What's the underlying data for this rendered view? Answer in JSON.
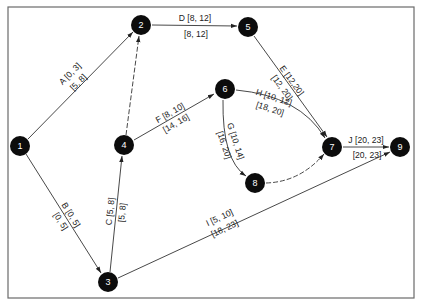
{
  "diagram": {
    "type": "activity-on-arrow network",
    "nodes": [
      {
        "id": "1",
        "x": 20,
        "y": 146
      },
      {
        "id": "2",
        "x": 141,
        "y": 25
      },
      {
        "id": "3",
        "x": 108,
        "y": 282
      },
      {
        "id": "4",
        "x": 124,
        "y": 145
      },
      {
        "id": "5",
        "x": 248,
        "y": 27
      },
      {
        "id": "6",
        "x": 225,
        "y": 89
      },
      {
        "id": "7",
        "x": 332,
        "y": 147
      },
      {
        "id": "8",
        "x": 255,
        "y": 183
      },
      {
        "id": "9",
        "x": 400,
        "y": 147
      }
    ],
    "activities": [
      {
        "name": "A",
        "from": "1",
        "to": "2",
        "es_ef": "A [0, 3]",
        "ls_lf": "[5, 8]"
      },
      {
        "name": "B",
        "from": "1",
        "to": "3",
        "es_ef": "B [0, 5]",
        "ls_lf": "[0, 5]"
      },
      {
        "name": "C",
        "from": "3",
        "to": "4",
        "es_ef": "C [5, 8]",
        "ls_lf": "[5, 8]"
      },
      {
        "name": "D",
        "from": "2",
        "to": "5",
        "es_ef": "D [8, 12]",
        "ls_lf": "[8, 12]"
      },
      {
        "name": "E",
        "from": "5",
        "to": "7",
        "es_ef": "E [12,20]",
        "ls_lf": "[12, 20]"
      },
      {
        "name": "F",
        "from": "4",
        "to": "6",
        "es_ef": "F [8, 10]",
        "ls_lf": "[14, 16]"
      },
      {
        "name": "G",
        "from": "6",
        "to": "8",
        "es_ef": "G [10, 14]",
        "ls_lf": "[16, 20]"
      },
      {
        "name": "H",
        "from": "6",
        "to": "7",
        "es_ef": "H [10, 12]",
        "ls_lf": "[18, 20]"
      },
      {
        "name": "I",
        "from": "3",
        "to": "9",
        "es_ef": "I [5, 10]",
        "ls_lf": "[18, 23]"
      },
      {
        "name": "J",
        "from": "7",
        "to": "9",
        "es_ef": "J [20, 23]",
        "ls_lf": "[20, 23]"
      }
    ],
    "dummies": [
      {
        "from": "4",
        "to": "2"
      },
      {
        "from": "8",
        "to": "7"
      }
    ],
    "colors": {
      "node_fill": "#0c0c0c",
      "node_text": "#ffffff",
      "edge": "#333333",
      "frame": "#6a6a6a"
    }
  }
}
